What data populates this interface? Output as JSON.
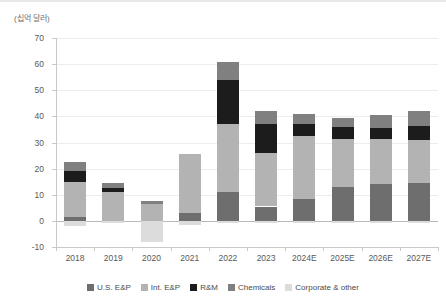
{
  "chart_data": {
    "type": "bar",
    "stacked": true,
    "title": "",
    "subtitle": "",
    "xlabel": "",
    "ylabel": "(십억 달러)",
    "ylim": [
      -10,
      70
    ],
    "ytick_step": 10,
    "yticks": [
      70,
      60,
      50,
      40,
      30,
      20,
      10,
      0,
      -10
    ],
    "grid": true,
    "legend_position": "bottom",
    "categories": [
      "2018",
      "2019",
      "2020",
      "2021",
      "2022",
      "2023",
      "2024E",
      "2025E",
      "2026E",
      "2027E"
    ],
    "series": [
      {
        "name": "U.S. E&P",
        "color": "#6e6e6e",
        "values": [
          1.5,
          0.0,
          0.0,
          3.0,
          11.0,
          5.5,
          8.5,
          13.0,
          14.0,
          14.5
        ]
      },
      {
        "name": "Int. E&P",
        "color": "#b3b3b3",
        "values": [
          13.5,
          11.0,
          6.5,
          22.5,
          26.0,
          20.5,
          24.0,
          18.5,
          17.5,
          16.5
        ]
      },
      {
        "name": "R&M",
        "color": "#1c1c1c",
        "values": [
          4.0,
          1.5,
          0.0,
          0.0,
          17.0,
          11.0,
          4.5,
          4.5,
          4.0,
          5.5
        ]
      },
      {
        "name": "Chemicals",
        "color": "#808080",
        "values": [
          3.5,
          2.0,
          1.0,
          0.0,
          7.0,
          5.0,
          4.0,
          3.5,
          5.0,
          5.5
        ]
      },
      {
        "name": "Corporate & other",
        "color": "#dcdcdc",
        "values": [
          -2.0,
          -1.0,
          -8.0,
          -1.5,
          -1.0,
          -1.0,
          -1.0,
          -1.0,
          -1.0,
          -1.0
        ]
      }
    ],
    "totals": [
      22.5,
      14.5,
      7.5,
      25.5,
      61.0,
      42.0,
      41.0,
      39.5,
      40.5,
      42.0
    ]
  },
  "legend": {
    "items": [
      {
        "label": "U.S. E&P",
        "color": "#6e6e6e"
      },
      {
        "label": "Int. E&P",
        "color": "#b3b3b3"
      },
      {
        "label": "R&M",
        "color": "#1c1c1c"
      },
      {
        "label": "Chemicals",
        "color": "#808080"
      },
      {
        "label": "Corporate & other",
        "color": "#dcdcdc"
      }
    ]
  },
  "axis": {
    "unit_label": "(십억 달러)"
  }
}
